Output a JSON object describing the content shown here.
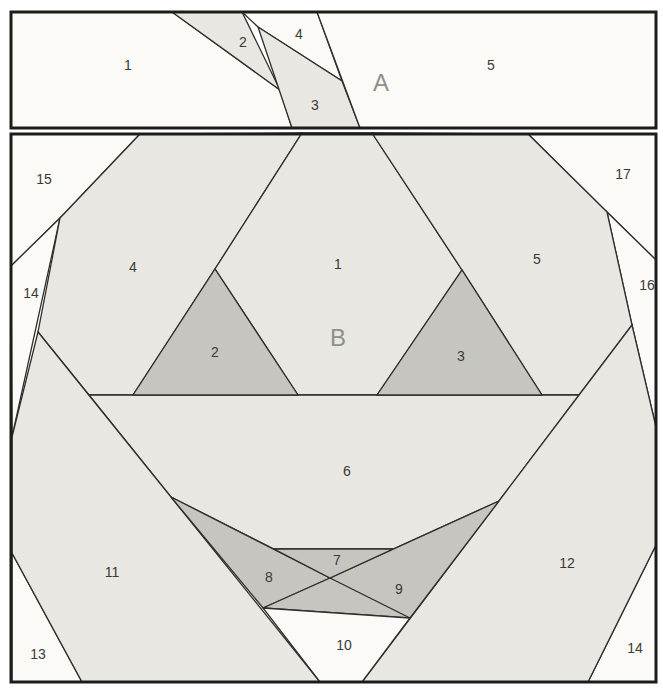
{
  "colors": {
    "body": "#e9e7e2",
    "shaded": "#c7c5c0",
    "white": "#fbfaf7"
  },
  "section_a": {
    "label": "A",
    "pieces": {
      "n1": "1",
      "n2": "2",
      "n3": "3",
      "n4": "4",
      "n5": "5"
    }
  },
  "section_b": {
    "label": "B",
    "pieces": {
      "n1": "1",
      "n2": "2",
      "n3": "3",
      "n4": "4",
      "n5": "5",
      "n6": "6",
      "n7": "7",
      "n8": "8",
      "n9": "9",
      "n10": "10",
      "n11": "11",
      "n12": "12",
      "n13": "13",
      "n14": "14",
      "n15": "15",
      "n16": "16",
      "n17": "17",
      "n14_right": "14"
    }
  }
}
